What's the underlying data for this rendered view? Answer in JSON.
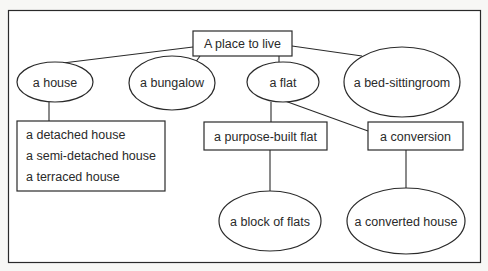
{
  "diagram": {
    "root": {
      "label": "A place to live"
    },
    "level1": [
      {
        "id": "house",
        "label": "a house",
        "shape": "ellipse"
      },
      {
        "id": "bungalow",
        "label": "a bungalow",
        "shape": "ellipse"
      },
      {
        "id": "flat",
        "label": "a flat",
        "shape": "ellipse"
      },
      {
        "id": "bedsit",
        "label": "a bed-sittingroom",
        "shape": "ellipse"
      }
    ],
    "house_types": {
      "shape": "box",
      "items": [
        "a detached house",
        "a semi-detached house",
        "a terraced house"
      ]
    },
    "flat_types": [
      {
        "id": "purpose_built",
        "label": "a purpose-built flat",
        "shape": "box"
      },
      {
        "id": "conversion",
        "label": "a conversion",
        "shape": "box"
      }
    ],
    "level3": [
      {
        "id": "block",
        "label": "a block of flats",
        "shape": "ellipse",
        "parent": "purpose_built"
      },
      {
        "id": "converted",
        "label": "a converted house",
        "shape": "ellipse",
        "parent": "conversion"
      }
    ],
    "edges": [
      [
        "A place to live",
        "a house"
      ],
      [
        "A place to live",
        "a bungalow"
      ],
      [
        "A place to live",
        "a flat"
      ],
      [
        "A place to live",
        "a bed-sittingroom"
      ],
      [
        "a house",
        "house types list"
      ],
      [
        "a flat",
        "a purpose-built flat"
      ],
      [
        "a flat",
        "a conversion"
      ],
      [
        "a purpose-built flat",
        "a block of flats"
      ],
      [
        "a conversion",
        "a converted house"
      ]
    ],
    "colors": {
      "line": "#2a2a2a",
      "background": "#f7f7f5",
      "fill": "#ffffff"
    }
  }
}
